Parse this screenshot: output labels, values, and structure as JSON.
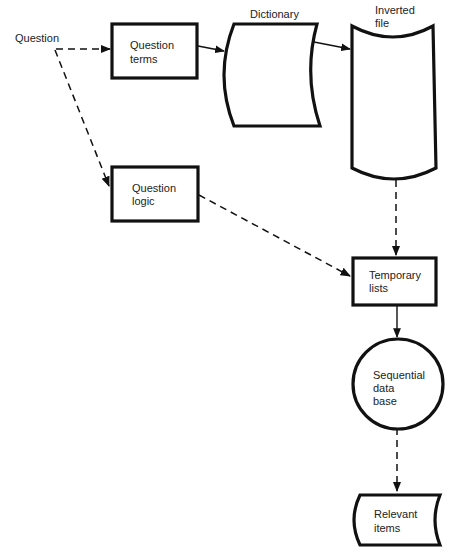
{
  "diagram": {
    "type": "flowchart",
    "nodes": [
      {
        "id": "question",
        "shape": "text",
        "label": [
          "Question"
        ]
      },
      {
        "id": "question_terms",
        "shape": "process",
        "label": [
          "Question",
          "terms"
        ]
      },
      {
        "id": "dictionary",
        "shape": "stored-data",
        "caption": "Dictionary",
        "label": []
      },
      {
        "id": "inverted_file",
        "shape": "magnetic-tape-drum",
        "caption": [
          "Inverted",
          "file"
        ],
        "label": []
      },
      {
        "id": "question_logic",
        "shape": "process",
        "label": [
          "Question",
          "logic"
        ]
      },
      {
        "id": "temporary_lists",
        "shape": "process",
        "label": [
          "Temporary",
          "lists"
        ]
      },
      {
        "id": "sequential_db",
        "shape": "circle",
        "label": [
          "Sequential",
          "data",
          "base"
        ]
      },
      {
        "id": "relevant_items",
        "shape": "stored-data",
        "label": [
          "Relevant",
          "items"
        ]
      }
    ],
    "edges": [
      {
        "from": "question",
        "to": "question_terms",
        "style": "dashed"
      },
      {
        "from": "question",
        "to": "question_logic",
        "style": "dashed"
      },
      {
        "from": "question_terms",
        "to": "dictionary",
        "style": "solid"
      },
      {
        "from": "dictionary",
        "to": "inverted_file",
        "style": "solid"
      },
      {
        "from": "inverted_file",
        "to": "temporary_lists",
        "style": "dashed"
      },
      {
        "from": "question_logic",
        "to": "temporary_lists",
        "style": "dashed"
      },
      {
        "from": "temporary_lists",
        "to": "sequential_db",
        "style": "solid"
      },
      {
        "from": "sequential_db",
        "to": "relevant_items",
        "style": "dashed"
      }
    ]
  },
  "labels": {
    "question": "Question",
    "question_terms": [
      "Question",
      "terms"
    ],
    "dictionary": "Dictionary",
    "inverted_file": [
      "Inverted",
      "file"
    ],
    "question_logic": [
      "Question",
      "logic"
    ],
    "temporary_lists": [
      "Temporary",
      "lists"
    ],
    "sequential_db": [
      "Sequential",
      "data",
      "base"
    ],
    "relevant_items": [
      "Relevant",
      "items"
    ]
  },
  "colors": {
    "stroke": "#111111",
    "text": "#222222",
    "background": "#ffffff"
  }
}
